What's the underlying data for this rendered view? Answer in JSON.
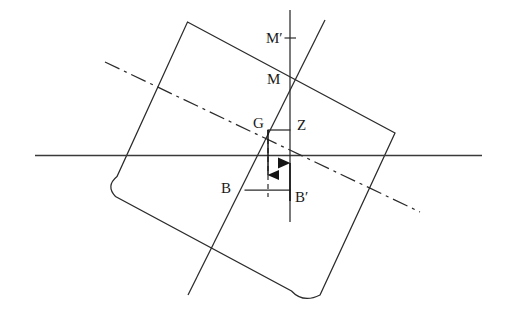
{
  "figure": {
    "name": "ship-stability-metacentre-diagram",
    "domain": "diagram",
    "width": 507,
    "height": 320,
    "background": "#ffffff",
    "stroke_color": "#262626",
    "text_color": "#1a1a1a"
  },
  "labels": {
    "m_prime": "M′",
    "m": "M",
    "g": "G",
    "z": "Z",
    "b": "B",
    "b_prime": "B′"
  },
  "label_positions": {
    "m_prime": {
      "x": 268,
      "y": 33
    },
    "m": {
      "x": 268,
      "y": 75
    },
    "g": {
      "x": 255,
      "y": 118
    },
    "z": {
      "x": 298,
      "y": 120
    },
    "b": {
      "x": 222,
      "y": 183
    },
    "b_prime": {
      "x": 296,
      "y": 192
    }
  },
  "geometry": {
    "hull": {
      "name": "tilted-hull-rectangle-with-rounded-bilges",
      "path": "M 187.5 22 L 395 133 L 320 295 Q 303 303 292 291 L 116 196 Q 106 186 117 177 Z",
      "corners": {
        "top_left": [
          187.5,
          22
        ],
        "top_right": [
          395,
          133
        ],
        "bottom_right": [
          320,
          295
        ],
        "bottom_left": [
          117,
          177
        ]
      },
      "tilt_degrees": 28
    },
    "waterline": {
      "name": "waterline",
      "x1": 35,
      "y1": 155,
      "x2": 482,
      "y2": 155,
      "style": "solid"
    },
    "inclined_centreline": {
      "name": "inclined-centreline-through-M-G-B",
      "x1": 325,
      "y1": 20,
      "x2": 188,
      "y2": 295,
      "style": "solid"
    },
    "hull_axis_dashdot": {
      "name": "hull-horizontal-axis",
      "x1": 105,
      "y1": 62,
      "x2": 420,
      "y2": 212,
      "style": "dash-dot"
    },
    "vertical_buoyancy_line": {
      "name": "vertical-line-through-Z-and-B-prime",
      "x": 290,
      "y1": 10,
      "y2": 222,
      "style": "solid"
    },
    "gz_arm": {
      "name": "gz-righting-arm",
      "x1": 268,
      "y1": 130,
      "x2": 290,
      "y2": 130,
      "style": "solid"
    },
    "b_arm": {
      "name": "b-to-b-prime-arm",
      "x1": 245,
      "y1": 190,
      "x2": 290,
      "y2": 190,
      "style": "solid"
    },
    "weight_vector": {
      "name": "weight-force-arrow-down",
      "x": 268,
      "y_from": 130,
      "y_to": 175,
      "direction": "down"
    },
    "gb_dashed": {
      "name": "dashed-line-G-to-B",
      "x": 268,
      "y1": 130,
      "y2": 196,
      "style": "dashed"
    },
    "buoyancy_vector": {
      "name": "buoyancy-force-arrow-up",
      "x": 290,
      "y_from": 200,
      "y_to": 163,
      "direction": "up"
    },
    "m_tick": {
      "name": "metacentre-tick-mark",
      "x1": 285,
      "y1": 38,
      "x2": 296,
      "y2": 38
    }
  },
  "points": {
    "M": {
      "x": 290,
      "y": 73,
      "description": "metacentre on vertical line"
    },
    "M_prime": {
      "x": 290,
      "y": 38,
      "description": "initial metacentre above M"
    },
    "G": {
      "x": 268,
      "y": 130,
      "description": "centre of gravity"
    },
    "Z": {
      "x": 290,
      "y": 130,
      "description": "foot of perpendicular from G to buoyancy line"
    },
    "B": {
      "x": 245,
      "y": 190,
      "description": "original centre of buoyancy"
    },
    "B_prime": {
      "x": 290,
      "y": 190,
      "description": "shifted centre of buoyancy"
    }
  }
}
